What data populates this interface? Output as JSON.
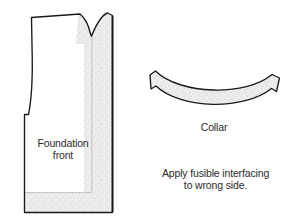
{
  "figure": {
    "kind": "sewing-pattern-diagram",
    "background_color": "#ffffff",
    "outline_color": "#1a1a1a",
    "interfacing_fill_color": "#e6e6e6",
    "text_color": "#2b2b2b"
  },
  "pieces": {
    "foundation": {
      "label_line_1": "Foundation",
      "label_line_2": "front",
      "label": "Foundation\nfront",
      "shape": "bodice-front-block",
      "interfacing_region": "right and bottom border band"
    },
    "collar": {
      "label": "Collar",
      "shape": "curved-band",
      "interfacing_region": "entire piece"
    }
  },
  "notes": {
    "instruction_line_1": "Apply fusible interfacing",
    "instruction_line_2": "to wrong side.",
    "instruction": "Apply fusible interfacing\nto wrong side."
  }
}
